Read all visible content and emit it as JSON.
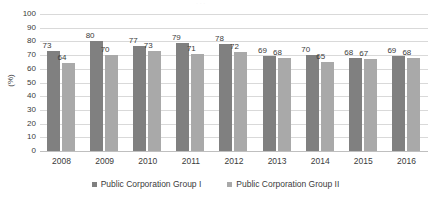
{
  "chart_data": {
    "type": "bar",
    "title": "",
    "xlabel": "",
    "ylabel": "(%)",
    "ylim": [
      0,
      100
    ],
    "ytick_step": 10,
    "yticks": [
      100,
      90,
      80,
      70,
      60,
      50,
      40,
      30,
      20,
      10,
      0
    ],
    "grid": true,
    "legend_position": "bottom",
    "categories": [
      "2008",
      "2009",
      "2010",
      "2011",
      "2012",
      "2013",
      "2014",
      "2015",
      "2016"
    ],
    "series": [
      {
        "name": "Public Corporation Group I",
        "color": "#808080",
        "values": [
          73,
          80,
          77,
          79,
          78,
          69,
          70,
          68,
          69
        ]
      },
      {
        "name": "Public Corporation Group II",
        "color": "#a9a9a9",
        "values": [
          64,
          70,
          73,
          71,
          72,
          68,
          65,
          67,
          68
        ]
      }
    ]
  },
  "axis": {
    "y_title": "(%)"
  },
  "legend": {
    "items": [
      {
        "label": "Public Corporation Group I",
        "swatch": "#808080"
      },
      {
        "label": "Public Corporation Group II",
        "swatch": "#a9a9a9"
      }
    ]
  },
  "artifacts": {
    "top_partial_text": "· · ·"
  }
}
